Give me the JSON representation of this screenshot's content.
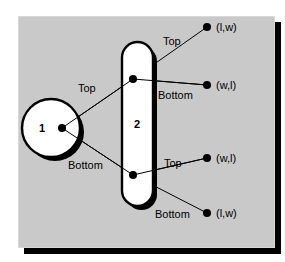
{
  "figure": {
    "panel_color": "#c9c9c9",
    "shadow_color": "#000000",
    "stroke_color": "#000000",
    "node_fill": "#ffffff"
  },
  "nodes": [
    {
      "id": "node-1",
      "label": "1",
      "shape": "circle",
      "cx": 51,
      "cy": 128,
      "r": 29
    },
    {
      "id": "node-2",
      "label": "2",
      "shape": "stadium",
      "x": 122,
      "y": 42,
      "width": 31,
      "height": 164
    }
  ],
  "junctions": [
    {
      "name": "node-1-port",
      "x": 62,
      "y": 128
    },
    {
      "name": "node-2-top-port",
      "x": 133,
      "y": 79
    },
    {
      "name": "node-2-bottom-port",
      "x": 133,
      "y": 175
    }
  ],
  "edges": [
    {
      "name": "edge-1-to-2-top",
      "label": "Top",
      "label_x": 78,
      "label_y": 83
    },
    {
      "name": "edge-1-to-2-bottom",
      "label": "Bottom",
      "label_x": 68,
      "label_y": 160
    },
    {
      "name": "edge-2top-to-terminal-a",
      "label": "Top",
      "label_x": 163,
      "label_y": 36
    },
    {
      "name": "edge-2top-to-terminal-b",
      "label": "Bottom",
      "label_x": 158,
      "label_y": 90
    },
    {
      "name": "edge-2bottom-to-terminal-c",
      "label": "Top",
      "label_x": 164,
      "label_y": 158
    },
    {
      "name": "edge-2bottom-to-terminal-d",
      "label": "Bottom",
      "label_x": 155,
      "label_y": 209
    }
  ],
  "terminals": [
    {
      "name": "terminal-lw-top",
      "label": "(l,w)",
      "dot_x": 207,
      "dot_y": 27,
      "label_x": 216,
      "label_y": 22
    },
    {
      "name": "terminal-wl-upper",
      "label": "(w,l)",
      "dot_x": 207,
      "dot_y": 85,
      "label_x": 216,
      "label_y": 80
    },
    {
      "name": "terminal-wl-lower",
      "label": "(w,l)",
      "dot_x": 207,
      "dot_y": 158,
      "label_x": 216,
      "label_y": 153
    },
    {
      "name": "terminal-lw-bottom",
      "label": "(l,w)",
      "dot_x": 207,
      "dot_y": 213,
      "label_x": 216,
      "label_y": 208
    }
  ]
}
